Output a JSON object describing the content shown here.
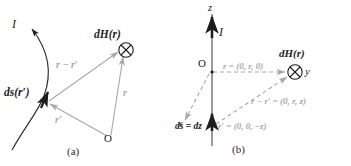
{
  "figure": {
    "background_color": "#ffffff",
    "ink_color": "#1d1d1d",
    "vector_color": "#a8a8a8",
    "panels": [
      {
        "id": "a",
        "caption": "(a)",
        "labels": {
          "current": "I",
          "source_element": "ds(r′)",
          "field_point": "dH(r)",
          "separation_vector": "r − r′",
          "field_position": "r",
          "source_position": "r′",
          "origin": "O"
        },
        "symbols": {
          "field_marker": "⊗"
        }
      },
      {
        "id": "b",
        "caption": "(b)",
        "labels": {
          "axis_z": "z",
          "axis_x": "x",
          "axis_y": "y",
          "current": "I",
          "origin": "O",
          "field_point": "dH(r)",
          "field_position": "r = (0, r, 0)",
          "separation_vector": "r − r′ = (0, r, z)",
          "source_element": "ds = dz",
          "source_position": "r′ = (0, 0, −z)"
        },
        "symbols": {
          "field_marker": "⊗"
        }
      }
    ]
  }
}
